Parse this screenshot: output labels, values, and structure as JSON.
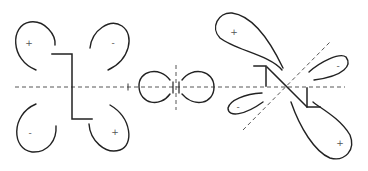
{
  "diagram": {
    "title": "",
    "colors": {
      "stroke": "#222222",
      "axis": "#444444",
      "sign": "#555555",
      "background": "#ffffff"
    },
    "left_orbital": {
      "lobes": [
        {
          "position": "top-left",
          "sign": "+"
        },
        {
          "position": "top-right",
          "sign": "-"
        },
        {
          "position": "bottom-left",
          "sign": "-"
        },
        {
          "position": "bottom-right",
          "sign": "+"
        }
      ]
    },
    "center_orbital": {
      "lobes": [
        {
          "position": "left",
          "sign": ""
        },
        {
          "position": "right",
          "sign": ""
        }
      ]
    },
    "right_orbital": {
      "lobes": [
        {
          "position": "upper-left-large",
          "sign": "+"
        },
        {
          "position": "upper-right-small",
          "sign": "-"
        },
        {
          "position": "lower-left-small",
          "sign": "-"
        },
        {
          "position": "lower-right-large",
          "sign": "+"
        }
      ]
    }
  }
}
